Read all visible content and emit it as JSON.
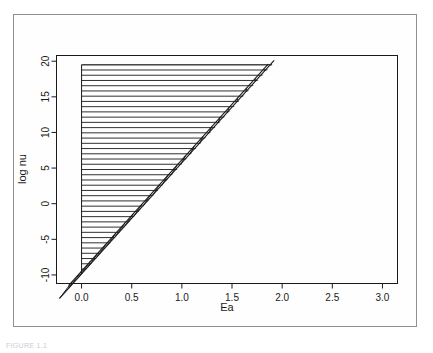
{
  "figure": {
    "caption": "FIGURE 1.1",
    "background_color": "#ffffff",
    "frame_color": "#8d9095",
    "line_color": "#1a1a1a"
  },
  "chart_data": {
    "type": "area",
    "title": "",
    "subtitle": "",
    "xlabel": "Ea",
    "ylabel": "log nu",
    "xlim": [
      -0.25,
      3.15
    ],
    "ylim": [
      -11.2,
      20.8
    ],
    "xticks": [
      0.0,
      0.5,
      1.0,
      1.5,
      2.0,
      2.5,
      3.0
    ],
    "xtick_labels": [
      "0.0",
      "0.5",
      "1.0",
      "1.5",
      "2.0",
      "2.5",
      "3.0"
    ],
    "yticks": [
      -10,
      -5,
      0,
      5,
      10,
      15,
      20
    ],
    "ytick_labels": [
      "-10",
      "-5",
      "0",
      "5",
      "10",
      "15",
      "20"
    ],
    "grid": false,
    "legend": null,
    "series": [
      {
        "name": "feasible-region",
        "kind": "hatched-polygon",
        "hatch": "horizontal",
        "hatch_line_count": 40,
        "vertices": [
          {
            "x": 0.0,
            "y": -9.9
          },
          {
            "x": 0.0,
            "y": 19.5
          },
          {
            "x": 1.9,
            "y": 19.5
          }
        ],
        "note": "triangle filled with evenly spaced horizontal hatch lines"
      },
      {
        "name": "lower-constraint-line",
        "kind": "line",
        "x": [
          -0.22,
          1.92
        ],
        "y": [
          -13.3,
          20.1
        ],
        "slope": 15.6,
        "intercept": -9.9,
        "ticked": false
      },
      {
        "name": "upper-constraint-line",
        "kind": "line",
        "x": [
          -0.13,
          1.86
        ],
        "y": [
          -11.5,
          19.6
        ],
        "slope": 15.6,
        "intercept": -9.5,
        "ticked": true,
        "tick_count": 23,
        "tick_note": "short hatch ticks drawn between the two parallel boundary lines"
      }
    ]
  }
}
